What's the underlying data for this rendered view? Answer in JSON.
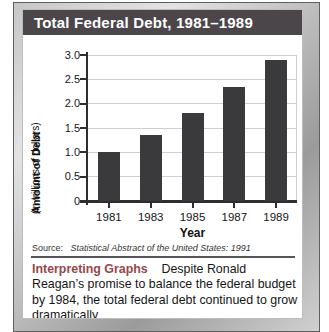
{
  "title_bar": {
    "title": "Total Federal Debt, 1981–1989"
  },
  "chart_data": {
    "type": "bar",
    "title": "Total Federal Debt, 1981–1989",
    "categories": [
      "1981",
      "1983",
      "1985",
      "1987",
      "1989"
    ],
    "values": [
      1.0,
      1.35,
      1.8,
      2.35,
      2.9
    ],
    "xlabel": "Year",
    "ylabel": "Amount of Debt",
    "ylabel_sub": "(in trillions of dollars)",
    "ylim": [
      0,
      3.0
    ],
    "ytick_step": 0.5,
    "yticks": [
      "0",
      "0.5",
      "1.0",
      "1.5",
      "2.0",
      "2.5",
      "3.0"
    ],
    "grid": true,
    "legend": "none",
    "bar_color": "#3a393b",
    "gridline_color": "#cfcfcf",
    "axis_color": "#2e2d2f"
  },
  "source": {
    "prefix": "Source:",
    "citation": "Statistical Abstract of the United States: 1991"
  },
  "note": {
    "heading": "Interpreting Graphs",
    "body": "Despite Ronald Reagan’s promise to balance the federal budget by 1984, the total federal debt continued to grow dramatically"
  },
  "colors": {
    "title_band_bg": "#4b4649",
    "title_text": "#ffffff",
    "frame_metal": "#b5b5b5",
    "frame_edge": "#5f5f5f",
    "note_heading": "#95484b"
  }
}
